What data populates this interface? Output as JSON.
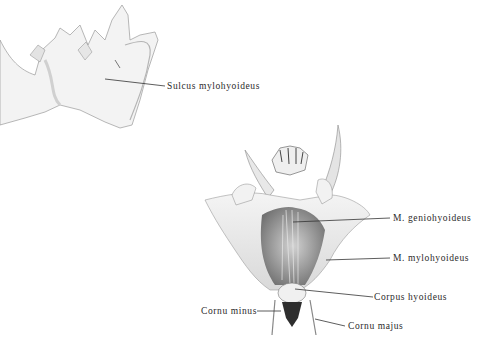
{
  "figure": {
    "top_view": {
      "labels": [
        {
          "id": "sulcus",
          "text": "Sulcus mylohyoideus"
        }
      ]
    },
    "bottom_view": {
      "labels": [
        {
          "id": "geniohyoideus",
          "text": "M. geniohyoideus"
        },
        {
          "id": "mylohyoideus",
          "text": "M. mylohyoideus"
        },
        {
          "id": "corpus",
          "text": "Corpus hyoideus"
        },
        {
          "id": "cornu_minus",
          "text": "Cornu minus"
        },
        {
          "id": "cornu_majus",
          "text": "Cornu majus"
        }
      ]
    }
  }
}
